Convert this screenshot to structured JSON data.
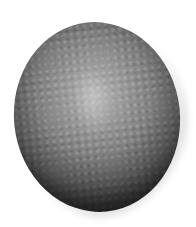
{
  "image": {
    "subject": "grayscale ovoid surface with cellular mesh texture",
    "background_color": "#ffffff",
    "colors": {
      "highlight": "#b4b4b4",
      "midtone": "#7e7e7e",
      "shadow": "#151515"
    }
  }
}
